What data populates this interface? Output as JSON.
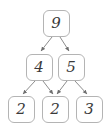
{
  "diagram": {
    "type": "number-decomposition-tree",
    "background_color": "#ffffff",
    "node_border_color": "#b4b4b4",
    "node_fill_color": "#ffffff",
    "node_text_color": "#3a3a3a",
    "edge_color": "#8c8c8c",
    "levels": [
      {
        "name": "root",
        "nodes": [
          {
            "id": "n9",
            "value": "9",
            "cx": 56,
            "cy": 23
          }
        ]
      },
      {
        "name": "middle",
        "nodes": [
          {
            "id": "n4",
            "value": "4",
            "cx": 39,
            "cy": 67
          },
          {
            "id": "n5",
            "value": "5",
            "cx": 71,
            "cy": 67
          }
        ]
      },
      {
        "name": "leaves",
        "nodes": [
          {
            "id": "l2a",
            "value": "2",
            "cx": 21,
            "cy": 109
          },
          {
            "id": "l2b",
            "value": "2",
            "cx": 55,
            "cy": 109
          },
          {
            "id": "l3",
            "value": "3",
            "cx": 89,
            "cy": 109
          }
        ]
      }
    ],
    "edges": [
      {
        "from": "n9",
        "to": "n4",
        "x1": 52,
        "y1": 37,
        "x2": 41,
        "y2": 51
      },
      {
        "from": "n9",
        "to": "n5",
        "x1": 60,
        "y1": 37,
        "x2": 69,
        "y2": 51
      },
      {
        "from": "n4",
        "to": "l2a",
        "x1": 35,
        "y1": 81,
        "x2": 23,
        "y2": 94
      },
      {
        "from": "n4",
        "to": "l2b",
        "x1": 43,
        "y1": 81,
        "x2": 53,
        "y2": 94
      },
      {
        "from": "n5",
        "to": "l2b",
        "x1": 67,
        "y1": 81,
        "x2": 57,
        "y2": 94
      },
      {
        "from": "n5",
        "to": "l3",
        "x1": 75,
        "y1": 81,
        "x2": 87,
        "y2": 94
      }
    ]
  }
}
